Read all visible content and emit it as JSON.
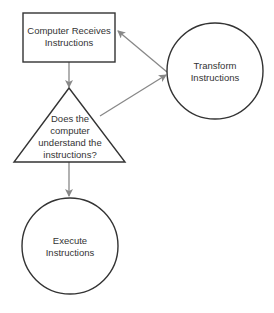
{
  "diagram": {
    "type": "flowchart",
    "nodes": [
      {
        "id": "receive",
        "shape": "rectangle",
        "lines": [
          "Computer Receives",
          "Instructions"
        ]
      },
      {
        "id": "decide",
        "shape": "triangle",
        "lines": [
          "Does the",
          "computer",
          "understand the",
          "instructions?"
        ]
      },
      {
        "id": "transform",
        "shape": "circle",
        "lines": [
          "Transform",
          "Instructions"
        ]
      },
      {
        "id": "execute",
        "shape": "circle",
        "lines": [
          "Execute",
          "Instructions"
        ]
      }
    ],
    "edges": [
      {
        "from": "receive",
        "to": "decide"
      },
      {
        "from": "decide",
        "to": "transform"
      },
      {
        "from": "transform",
        "to": "receive"
      },
      {
        "from": "decide",
        "to": "execute"
      }
    ],
    "colors": {
      "stroke": "#333333",
      "arrow": "#888888",
      "text": "#333333"
    }
  }
}
